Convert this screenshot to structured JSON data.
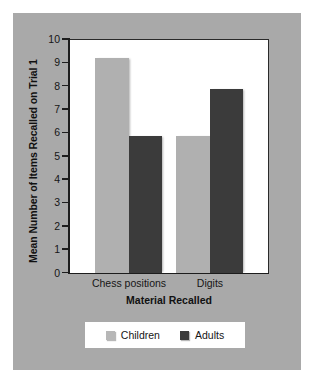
{
  "chart_data": {
    "type": "bar",
    "title": "",
    "xlabel": "Material Recalled",
    "ylabel": "Mean Number of Items Recalled on Trial 1",
    "categories": [
      "Chess positions",
      "Digits"
    ],
    "series": [
      {
        "name": "Children",
        "color": "#b0b0b0",
        "values": [
          9.2,
          5.85
        ]
      },
      {
        "name": "Adults",
        "color": "#3b3b3b",
        "values": [
          5.85,
          7.85
        ]
      }
    ],
    "ylim": [
      0,
      10
    ],
    "yticks": [
      "0",
      "1",
      "2",
      "3",
      "4",
      "5",
      "6",
      "7",
      "8",
      "9",
      "10"
    ],
    "grid": false,
    "legend_position": "bottom",
    "background_color": "#a9a9a9",
    "plot_background_color": "#ffffff"
  },
  "legend": {
    "items": [
      {
        "label": "Children"
      },
      {
        "label": "Adults"
      }
    ]
  }
}
